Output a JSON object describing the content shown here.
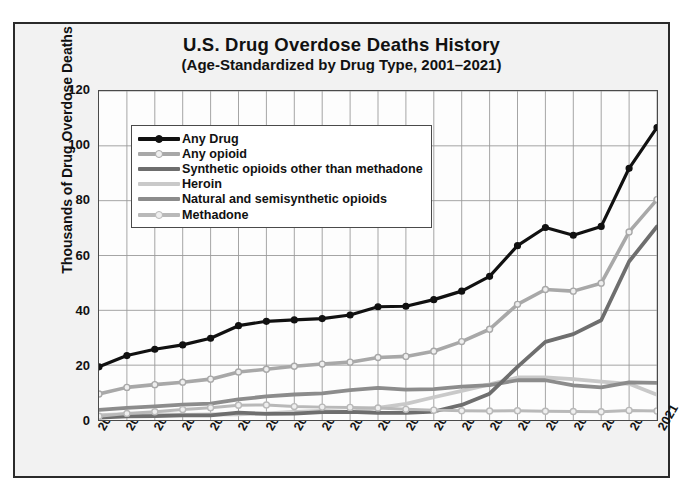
{
  "chart_data": {
    "type": "line",
    "title": "U.S. Drug Overdose Deaths History",
    "subtitle": "(Age-Standardized by Drug Type, 2001–2021)",
    "xlabel": "",
    "ylabel": "Thousands of Drug Overdose Deaths",
    "ylim": [
      0,
      120
    ],
    "yticks": [
      0,
      20,
      40,
      60,
      80,
      100,
      120
    ],
    "grid": true,
    "legend_position": "upper-left-inside",
    "x": [
      2001,
      2002,
      2003,
      2004,
      2005,
      2006,
      2007,
      2008,
      2009,
      2010,
      2011,
      2012,
      2013,
      2014,
      2015,
      2016,
      2017,
      2018,
      2019,
      2020,
      2021
    ],
    "categories": [
      "2001",
      "2002",
      "2003",
      "2004",
      "2005",
      "2006",
      "2007",
      "2008",
      "2009",
      "2010",
      "2011",
      "2012",
      "2013",
      "2014",
      "2015",
      "2016",
      "2017",
      "2018",
      "2019",
      "2020",
      "2021"
    ],
    "series": [
      {
        "name": "Any Drug",
        "color": "#111111",
        "marker": true,
        "width": 3.2,
        "values": [
          19.4,
          23.5,
          25.8,
          27.4,
          29.8,
          34.4,
          36.0,
          36.5,
          37.0,
          38.3,
          41.3,
          41.5,
          43.9,
          47.0,
          52.4,
          63.6,
          70.2,
          67.4,
          70.6,
          91.8,
          106.7
        ]
      },
      {
        "name": "Any opioid",
        "color": "#a8a8a8",
        "marker": true,
        "width": 3.6,
        "values": [
          9.5,
          11.9,
          12.9,
          13.8,
          14.9,
          17.5,
          18.5,
          19.6,
          20.4,
          21.1,
          22.8,
          23.2,
          25.1,
          28.6,
          33.1,
          42.2,
          47.6,
          47.0,
          49.9,
          68.6,
          80.4
        ]
      },
      {
        "name": "Synthetic opioids other than methadone",
        "color": "#6e6e6e",
        "marker": false,
        "width": 3.8,
        "values": [
          0.9,
          1.3,
          1.4,
          1.7,
          1.7,
          2.7,
          2.2,
          2.3,
          2.9,
          3.0,
          2.6,
          2.6,
          3.1,
          5.5,
          9.6,
          19.4,
          28.5,
          31.3,
          36.4,
          57.8,
          70.6
        ]
      },
      {
        "name": "Heroin",
        "color": "#c9c9c9",
        "marker": false,
        "width": 3.8,
        "values": [
          1.8,
          2.1,
          2.1,
          1.9,
          2.0,
          2.1,
          2.4,
          3.0,
          3.3,
          3.0,
          4.4,
          5.9,
          8.3,
          10.6,
          13.0,
          15.5,
          15.5,
          14.9,
          14.0,
          13.2,
          9.2
        ]
      },
      {
        "name": "Natural and semisynthetic opioids",
        "color": "#8c8c8c",
        "marker": false,
        "width": 3.8,
        "values": [
          3.7,
          4.4,
          5.0,
          5.6,
          6.0,
          7.5,
          8.6,
          9.3,
          9.7,
          10.9,
          11.7,
          11.1,
          11.3,
          12.2,
          12.7,
          14.5,
          14.5,
          12.6,
          11.9,
          13.7,
          13.5
        ]
      },
      {
        "name": "Methadone",
        "color": "#b9b9b9",
        "marker": true,
        "width": 3.0,
        "values": [
          1.4,
          2.4,
          3.0,
          3.8,
          4.5,
          5.4,
          5.5,
          4.9,
          4.7,
          4.6,
          4.4,
          3.9,
          3.6,
          3.4,
          3.3,
          3.4,
          3.2,
          3.1,
          3.0,
          3.5,
          3.3
        ]
      }
    ],
    "annotations": [
      {
        "label": "106.70",
        "x": 2021,
        "y": 106.7,
        "series": "Any Drug"
      },
      {
        "label": "80.4",
        "x": 2021,
        "y": 80.4,
        "series": "Any opioid"
      },
      {
        "label": "70.6",
        "x": 2021,
        "y": 70.6,
        "series": "Synthetic opioids other than methadone"
      }
    ]
  },
  "legend": {
    "items": [
      {
        "label": "Any Drug"
      },
      {
        "label": "Any opioid"
      },
      {
        "label": "Synthetic opioids other than methadone"
      },
      {
        "label": "Heroin"
      },
      {
        "label": "Natural and semisynthetic opioids"
      },
      {
        "label": "Methadone"
      }
    ]
  }
}
